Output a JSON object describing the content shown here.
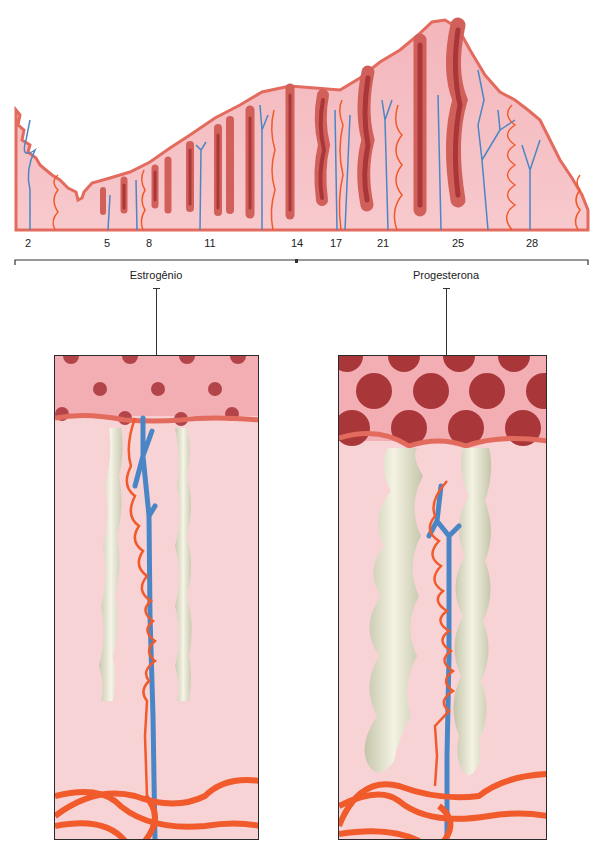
{
  "figure": {
    "cycle_days": [
      "2",
      "5",
      "8",
      "11",
      "14",
      "17",
      "21",
      "25",
      "28"
    ],
    "phases": [
      {
        "label": "Estrogênio"
      },
      {
        "label": "Progesterona"
      }
    ],
    "colors": {
      "tissue": "#f4b8bd",
      "tissue_light": "#f9d5d8",
      "surface": "#e36b5e",
      "gland_dark": "#a9373a",
      "gland_mid": "#d1605a",
      "artery": "#f15a2b",
      "vein": "#4a86c5",
      "gland_tube": "#ecebd9",
      "outline": "#2a2a2a"
    }
  }
}
